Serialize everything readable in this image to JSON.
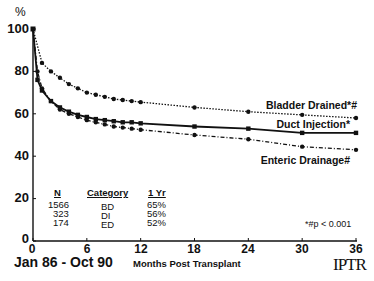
{
  "chart_data": {
    "type": "line",
    "title": "",
    "xlabel": "Months Post Transplant",
    "ylabel": "%",
    "xlim": [
      0,
      36
    ],
    "ylim": [
      0,
      100
    ],
    "x_ticks": [
      0,
      6,
      12,
      18,
      24,
      30,
      36
    ],
    "y_ticks": [
      0,
      20,
      40,
      60,
      80,
      100
    ],
    "grid": false,
    "series": [
      {
        "name": "Bladder Drained*#",
        "style": "dotted",
        "x": [
          0,
          1,
          2,
          3,
          4,
          5,
          6,
          7,
          8,
          9,
          10,
          11,
          12,
          18,
          24,
          30,
          36
        ],
        "values": [
          100,
          84,
          80,
          77,
          74,
          72,
          70,
          69,
          68,
          67,
          66.5,
          66,
          65.5,
          63,
          61,
          59.5,
          58
        ]
      },
      {
        "name": "Duct Injection*",
        "style": "solid",
        "x": [
          0,
          0.5,
          1,
          2,
          3,
          4,
          5,
          6,
          7,
          8,
          9,
          10,
          11,
          12,
          18,
          24,
          30,
          36
        ],
        "values": [
          100,
          76,
          71,
          66,
          63,
          61,
          59.5,
          58.5,
          57.5,
          57,
          56.5,
          56,
          56,
          55.5,
          54,
          53,
          51,
          51
        ]
      },
      {
        "name": "Enteric Drainage#",
        "style": "dash-dot",
        "x": [
          0,
          0.5,
          1,
          2,
          3,
          4,
          5,
          6,
          7,
          8,
          9,
          10,
          11,
          12,
          18,
          24,
          30,
          36
        ],
        "values": [
          100,
          80,
          72,
          66,
          62,
          60,
          58.5,
          57,
          56,
          55,
          54,
          53.5,
          53,
          52.5,
          50,
          48,
          44.5,
          43
        ]
      }
    ],
    "annotations": [
      "Jan 86 - Oct 90",
      "*#p < 0.001",
      "IPTR"
    ],
    "table": {
      "headers": [
        "N",
        "Category",
        "1 Yr"
      ],
      "rows": [
        [
          "1566",
          "BD",
          "65%"
        ],
        [
          "323",
          "DI",
          "56%"
        ],
        [
          "174",
          "ED",
          "52%"
        ]
      ]
    }
  },
  "axis": {
    "y_unit": "%",
    "y_ticks": [
      "100",
      "80",
      "60",
      "40",
      "20",
      "0"
    ],
    "x_ticks": [
      "0",
      "6",
      "12",
      "18",
      "24",
      "30",
      "36"
    ],
    "x_label": "Months Post Transplant"
  },
  "legend": {
    "bd": "Bladder Drained*#",
    "di": "Duct Injection*",
    "ed": "Enteric Drainage#"
  },
  "table": {
    "h_n": "N",
    "h_cat": "Category",
    "h_yr": "1 Yr",
    "rows": [
      {
        "n": "1566",
        "cat": "BD",
        "yr": "65%"
      },
      {
        "n": "323",
        "cat": "DI",
        "yr": "56%"
      },
      {
        "n": "174",
        "cat": "ED",
        "yr": "52%"
      }
    ]
  },
  "footer": {
    "date_range": "Jan 86 - Oct 90",
    "pvalue": "*#p < 0.001",
    "logo": "IPTR"
  }
}
